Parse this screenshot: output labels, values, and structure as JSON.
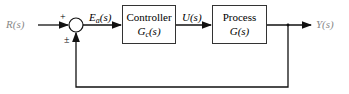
{
  "diagram": {
    "input": {
      "label": "R(s)"
    },
    "summing_junction": {
      "plus_sign": "+",
      "feedback_sign": "±"
    },
    "error_signal": {
      "label_main": "E",
      "label_sub": "a",
      "label_tail": "(s)"
    },
    "controller": {
      "title": "Controller",
      "tf_main": "G",
      "tf_sub": "c",
      "tf_tail": "(s)"
    },
    "control_signal": {
      "label": "U(s)"
    },
    "process": {
      "title": "Process",
      "tf": "G(s)"
    },
    "output": {
      "label": "Y(s)"
    }
  }
}
